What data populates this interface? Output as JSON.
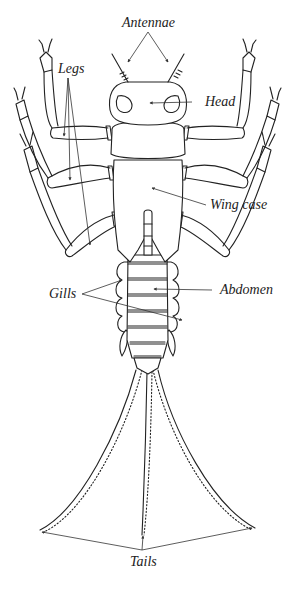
{
  "diagram": {
    "labels": {
      "antennae": "Antennae",
      "head": "Head",
      "legs": "Legs",
      "wing_case": "Wing case",
      "gills": "Gills",
      "abdomen": "Abdomen",
      "tails": "Tails"
    },
    "colors": {
      "line": "#222222",
      "background": "#ffffff"
    }
  }
}
